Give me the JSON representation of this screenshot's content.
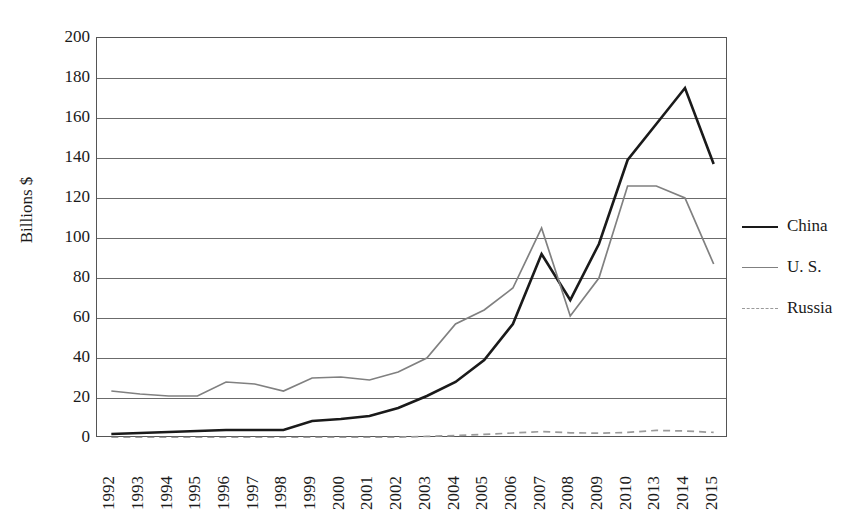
{
  "chart_data": {
    "type": "line",
    "title": "",
    "xlabel": "",
    "ylabel": "Billions $",
    "ylim": [
      0,
      200
    ],
    "ytick_step": 20,
    "yticks": [
      200,
      180,
      160,
      140,
      120,
      100,
      80,
      60,
      40,
      20,
      0
    ],
    "grid": true,
    "legend_position": "right",
    "categories": [
      "1992",
      "1993",
      "1994",
      "1995",
      "1996",
      "1997",
      "1998",
      "1999",
      "2000",
      "2001",
      "2002",
      "2003",
      "2004",
      "2005",
      "2006",
      "2007",
      "2008",
      "2009",
      "2010",
      "2013",
      "2014",
      "2015"
    ],
    "series": [
      {
        "name": "China",
        "color": "#1a1a1a",
        "style": "solid",
        "width": 2.6,
        "values": [
          2,
          2.5,
          3,
          3.5,
          4,
          4,
          4,
          8.5,
          9.5,
          11,
          15,
          21,
          28,
          39,
          57,
          92,
          69,
          97,
          139,
          157,
          175,
          137
        ]
      },
      {
        "name": "U. S.",
        "color": "#808080",
        "style": "solid",
        "width": 1.7,
        "values": [
          23.5,
          22,
          21,
          21,
          28,
          27,
          23.5,
          30,
          30.5,
          29,
          33,
          40,
          57,
          64,
          75,
          105,
          61,
          80,
          126,
          126,
          120,
          87
        ]
      },
      {
        "name": "Russia",
        "color": "#9a9a9a",
        "style": "dashed",
        "width": 1.7,
        "values": [
          0.2,
          0.2,
          0.2,
          0.2,
          0.2,
          0.2,
          0.2,
          0.3,
          0.3,
          0.3,
          0.4,
          0.8,
          1.2,
          1.8,
          2.5,
          3.2,
          2.6,
          2.4,
          2.8,
          3.8,
          3.5,
          2.8
        ]
      }
    ],
    "legend": [
      {
        "label": "China"
      },
      {
        "label": "U. S."
      },
      {
        "label": "Russia"
      }
    ]
  }
}
